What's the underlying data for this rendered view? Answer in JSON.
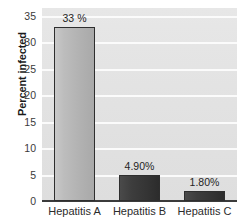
{
  "chart_data": {
    "type": "bar",
    "title": "",
    "xlabel": "",
    "ylabel": "Percent infected",
    "categories": [
      "Hepatitis A",
      "Hepatitis B",
      "Hepatitis C"
    ],
    "values": [
      33,
      4.9,
      1.8
    ],
    "data_labels": [
      "33 %",
      "4.90%",
      "1.80%"
    ],
    "ylim": [
      0,
      35
    ],
    "yticks": [
      0,
      5,
      10,
      15,
      20,
      25,
      30,
      35
    ],
    "ytick_labels": [
      "0",
      "5",
      "10",
      "15",
      "20",
      "25",
      "30",
      "35"
    ],
    "grid": "horizontal",
    "legend": "none",
    "colors": {
      "plot_background": "#e3e3e3",
      "gridline": "#fbfbfb",
      "axis_line": "#3b3b3b",
      "bar_light": "#b8b8b8",
      "bar_dark": "#373737",
      "bar_border": "#2e2e2e",
      "text": "#2b2b2b",
      "page_background": "#ffffff"
    },
    "series": [
      {
        "name": "Percent infected",
        "points": [
          {
            "category": "Hepatitis A",
            "value": 33,
            "label": "33 %",
            "shade": "light"
          },
          {
            "category": "Hepatitis B",
            "value": 4.9,
            "label": "4.90%",
            "shade": "dark"
          },
          {
            "category": "Hepatitis C",
            "value": 1.8,
            "label": "1.80%",
            "shade": "dark"
          }
        ]
      }
    ]
  }
}
